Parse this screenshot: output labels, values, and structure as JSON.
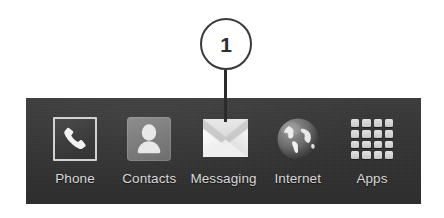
{
  "callout": {
    "number": "1",
    "target": "messaging"
  },
  "dock": {
    "background_color": "#343434",
    "label_color": "#d8d8d8",
    "items": [
      {
        "id": "phone",
        "label": "Phone",
        "icon": "phone-handset-icon"
      },
      {
        "id": "contacts",
        "label": "Contacts",
        "icon": "contacts-person-icon"
      },
      {
        "id": "messaging",
        "label": "Messaging",
        "icon": "envelope-icon"
      },
      {
        "id": "internet",
        "label": "Internet",
        "icon": "globe-icon"
      },
      {
        "id": "apps",
        "label": "Apps",
        "icon": "apps-grid-icon"
      }
    ]
  }
}
